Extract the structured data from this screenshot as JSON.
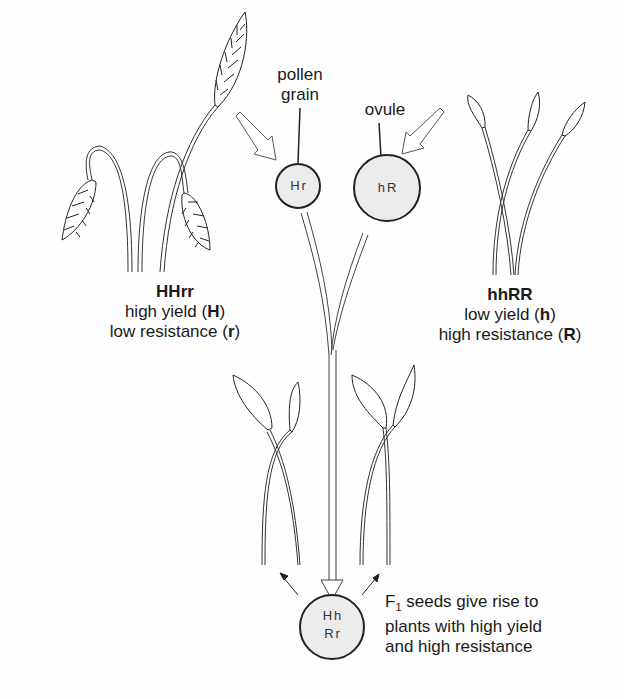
{
  "parent_left": {
    "genotype": "HHrr",
    "line1_text": "high yield (",
    "line1_allele": "H",
    "line2_text": "low resistance (",
    "line2_allele": "r",
    "close": ")"
  },
  "parent_right": {
    "genotype": "hhRR",
    "line1_text": "low yield (",
    "line1_allele": "h",
    "line2_text": "high resistance (",
    "line2_allele": "R",
    "close": ")"
  },
  "pollen": {
    "label_line1": "pollen",
    "label_line2": "grain",
    "alleles": "Hr"
  },
  "ovule": {
    "label": "ovule",
    "alleles": "hR"
  },
  "f1": {
    "alleles_line1": "Hh",
    "alleles_line2": "Rr",
    "caption_prefix": "F",
    "caption_sub": "1",
    "caption_line1": " seeds give rise to",
    "caption_line2": "plants with high yield",
    "caption_line3": "and high resistance"
  },
  "colors": {
    "ink": "#1a1a1a",
    "cell_fill": "#ececec",
    "paper": "#fefefe"
  }
}
